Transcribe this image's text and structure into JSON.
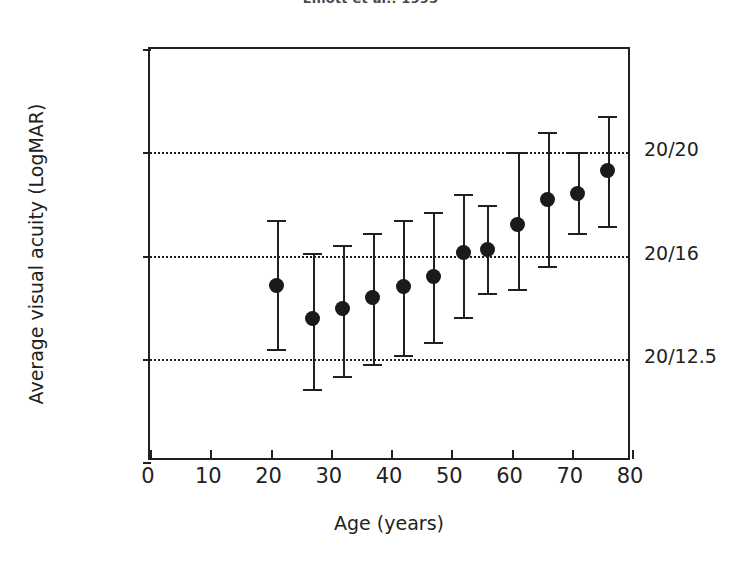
{
  "chart_data": {
    "type": "scatter",
    "title": "Elliott et al., 1995",
    "xlabel": "Age (years)",
    "ylabel": "Average visual acuity (LogMAR)",
    "xlim": [
      0,
      80
    ],
    "ylim": [
      -0.3,
      0.1
    ],
    "grid": true,
    "gridlines_y": [
      0.0,
      -0.1,
      -0.2
    ],
    "legend": "none",
    "xticks": [
      0,
      10,
      20,
      30,
      40,
      50,
      60,
      70,
      80
    ],
    "xtick_labels": [
      "0",
      "10",
      "20",
      "30",
      "40",
      "50",
      "60",
      "70",
      "80"
    ],
    "yticks": [
      0.1,
      0.0,
      -0.1,
      -0.2,
      -0.3
    ],
    "ytick_labels": [
      "0.1",
      "0.0",
      "-0.1",
      "-0.2",
      "-0.3"
    ],
    "secondary_axis": {
      "position": "right",
      "label": "Snellen equivalent",
      "ticks": [
        0.0,
        -0.1,
        -0.2
      ],
      "tick_labels": [
        "20/20",
        "20/16",
        "20/12.5"
      ]
    },
    "x": [
      21,
      27,
      32,
      37,
      42,
      47,
      52,
      56,
      61,
      66,
      71,
      76
    ],
    "y": [
      -0.129,
      -0.161,
      -0.151,
      -0.141,
      -0.13,
      -0.12,
      -0.097,
      -0.094,
      -0.07,
      -0.046,
      -0.04,
      -0.018
    ],
    "yerr_lower": [
      -0.191,
      -0.229,
      -0.217,
      -0.205,
      -0.196,
      -0.184,
      -0.16,
      -0.136,
      -0.132,
      -0.11,
      -0.078,
      -0.071
    ],
    "yerr_upper": [
      -0.066,
      -0.098,
      -0.09,
      -0.078,
      -0.066,
      -0.058,
      -0.04,
      -0.051,
      0.0,
      0.02,
      0.0,
      0.035
    ],
    "series_name": "Average visual acuity",
    "marker": "filled-circle",
    "marker_color": "#1a1a1a",
    "errorbar_color": "#231f20",
    "n_points": 12
  }
}
